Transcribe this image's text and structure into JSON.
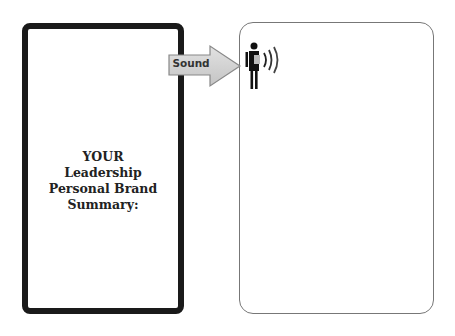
{
  "left_panel": {
    "lines": [
      "YOUR",
      "Leadership",
      "Personal Brand",
      "Summary:"
    ]
  },
  "arrow": {
    "label": "Sound",
    "fill_color": "#d0d0d0",
    "stroke_color": "#888888"
  },
  "right_panel": {
    "icon": "person-speaking-icon"
  }
}
